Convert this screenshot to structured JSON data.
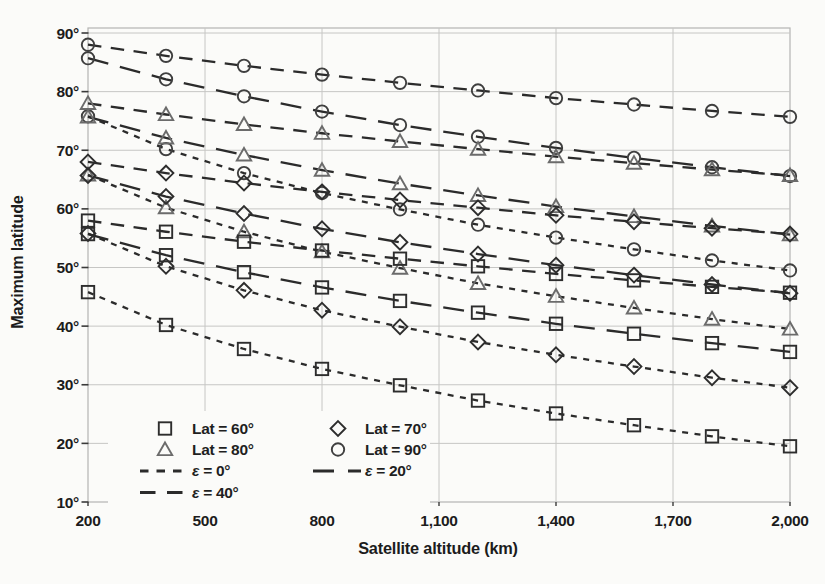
{
  "page": {
    "background": "#fbfbf9"
  },
  "chart_data": {
    "type": "line",
    "title": "",
    "xlabel": "Satellite altitude (km)",
    "ylabel": "Maximum latitude",
    "xlim": [
      200,
      2000
    ],
    "ylim": [
      10,
      90
    ],
    "grid": true,
    "legend_position": "lower-left",
    "x_ticks": [
      {
        "value": 200,
        "label": "200"
      },
      {
        "value": 500,
        "label": "500"
      },
      {
        "value": 800,
        "label": "800"
      },
      {
        "value": 1100,
        "label": "1,100"
      },
      {
        "value": 1400,
        "label": "1,400"
      },
      {
        "value": 1700,
        "label": "1,700"
      },
      {
        "value": 2000,
        "label": "2,000"
      }
    ],
    "y_ticks": [
      {
        "value": 10,
        "label": "10°"
      },
      {
        "value": 20,
        "label": "20°"
      },
      {
        "value": 30,
        "label": "30°"
      },
      {
        "value": 40,
        "label": "40°"
      },
      {
        "value": 50,
        "label": "50°"
      },
      {
        "value": 60,
        "label": "60°"
      },
      {
        "value": 70,
        "label": "70°"
      },
      {
        "value": 80,
        "label": "80°"
      },
      {
        "value": 90,
        "label": "90°"
      }
    ],
    "x": [
      200,
      400,
      600,
      800,
      1000,
      1200,
      1400,
      1600,
      1800,
      2000
    ],
    "series": [
      {
        "name": "Lat = 90°, ε = 40°",
        "lat": 90,
        "elevation": 40,
        "marker": "circle",
        "dash": "medium",
        "values": [
          88.0,
          86.1,
          84.4,
          82.9,
          81.5,
          80.2,
          78.9,
          77.8,
          76.7,
          75.7
        ]
      },
      {
        "name": "Lat = 90°, ε = 20°",
        "lat": 90,
        "elevation": 20,
        "marker": "circle",
        "dash": "long",
        "values": [
          85.7,
          82.1,
          79.2,
          76.6,
          74.3,
          72.3,
          70.4,
          68.7,
          67.1,
          65.6
        ]
      },
      {
        "name": "Lat = 90°, ε = 0°",
        "lat": 90,
        "elevation": 0,
        "marker": "circle",
        "dash": "short",
        "values": [
          75.8,
          70.2,
          66.1,
          62.7,
          59.9,
          57.3,
          55.1,
          53.1,
          51.2,
          49.5
        ]
      },
      {
        "name": "Lat = 80°, ε = 40°",
        "lat": 80,
        "elevation": 40,
        "marker": "triangle",
        "dash": "medium",
        "values": [
          78.0,
          76.1,
          74.4,
          72.9,
          71.5,
          70.2,
          68.9,
          67.8,
          66.7,
          65.7
        ]
      },
      {
        "name": "Lat = 80°, ε = 20°",
        "lat": 80,
        "elevation": 20,
        "marker": "triangle",
        "dash": "long",
        "values": [
          75.7,
          72.1,
          69.2,
          66.6,
          64.3,
          62.3,
          60.4,
          58.7,
          57.1,
          55.6
        ]
      },
      {
        "name": "Lat = 80°, ε = 0°",
        "lat": 80,
        "elevation": 0,
        "marker": "triangle",
        "dash": "short",
        "values": [
          65.8,
          60.2,
          56.1,
          52.7,
          49.9,
          47.3,
          45.1,
          43.1,
          41.2,
          39.5
        ]
      },
      {
        "name": "Lat = 70°, ε = 40°",
        "lat": 70,
        "elevation": 40,
        "marker": "diamond",
        "dash": "medium",
        "values": [
          68.0,
          66.1,
          64.4,
          62.9,
          61.5,
          60.2,
          58.9,
          57.8,
          56.7,
          55.7
        ]
      },
      {
        "name": "Lat = 70°, ε = 20°",
        "lat": 70,
        "elevation": 20,
        "marker": "diamond",
        "dash": "long",
        "values": [
          65.7,
          62.1,
          59.2,
          56.6,
          54.3,
          52.3,
          50.4,
          48.7,
          47.1,
          45.6
        ]
      },
      {
        "name": "Lat = 70°, ε = 0°",
        "lat": 70,
        "elevation": 0,
        "marker": "diamond",
        "dash": "short",
        "values": [
          55.8,
          50.2,
          46.1,
          42.7,
          39.9,
          37.3,
          35.1,
          33.1,
          31.2,
          29.5
        ]
      },
      {
        "name": "Lat = 60°, ε = 40°",
        "lat": 60,
        "elevation": 40,
        "marker": "square",
        "dash": "medium",
        "values": [
          58.0,
          56.1,
          54.4,
          52.9,
          51.5,
          50.2,
          48.9,
          47.8,
          46.7,
          45.7
        ]
      },
      {
        "name": "Lat = 60°, ε = 20°",
        "lat": 60,
        "elevation": 20,
        "marker": "square",
        "dash": "long",
        "values": [
          55.7,
          52.1,
          49.2,
          46.6,
          44.3,
          42.3,
          40.4,
          38.7,
          37.1,
          35.6
        ]
      },
      {
        "name": "Lat = 60°, ε = 0°",
        "lat": 60,
        "elevation": 0,
        "marker": "square",
        "dash": "short",
        "values": [
          45.8,
          40.2,
          36.1,
          32.7,
          29.9,
          27.3,
          25.1,
          23.1,
          21.2,
          19.5
        ]
      }
    ],
    "legend": {
      "marker_items": [
        {
          "shape": "square",
          "label": "Lat = 60°"
        },
        {
          "shape": "diamond",
          "label": "Lat = 70°"
        },
        {
          "shape": "triangle",
          "label": "Lat = 80°"
        },
        {
          "shape": "circle",
          "label": "Lat = 90°"
        }
      ],
      "line_items": [
        {
          "dash": "short",
          "label": "ε = 0°"
        },
        {
          "dash": "long",
          "label": "ε = 20°"
        },
        {
          "dash": "medium",
          "label": "ε = 40°"
        }
      ]
    },
    "styles": {
      "ink": "#2b2b2b",
      "grid_color": "#c6c6c4",
      "border_color": "#b4b4b2",
      "tick_color": "#3a3a3a",
      "marker_colors": {
        "square": "#2d2d2d",
        "diamond": "#2d2d2d",
        "triangle": "#6b6b6b",
        "circle": "#3f3f3f"
      },
      "dash_patterns": {
        "short": "6 6.5",
        "medium": "13.5 9.5",
        "long": "21 12"
      },
      "legend_dash_patterns": {
        "short": "8.5 8",
        "medium": "15.5 11.5",
        "long": "21 14"
      }
    }
  }
}
